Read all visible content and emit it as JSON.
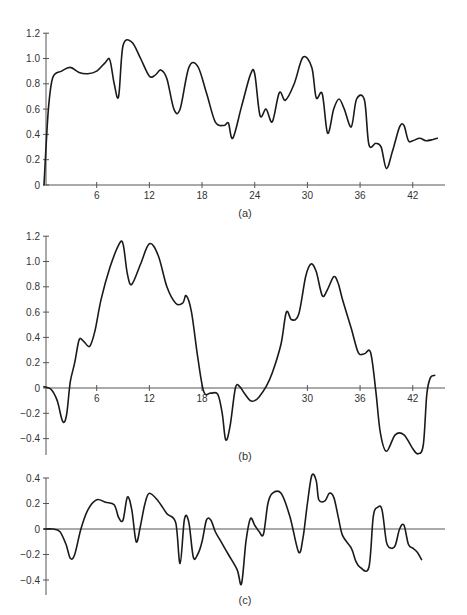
{
  "chart_data": [
    {
      "id": "a",
      "type": "line",
      "caption": "(a)",
      "xlabel": "",
      "ylabel": "",
      "xlim": [
        0,
        45
      ],
      "ylim": [
        0,
        1.2
      ],
      "x_ticks": [
        6,
        12,
        18,
        24,
        30,
        36,
        42
      ],
      "y_ticks": [
        0,
        0.2,
        0.4,
        0.6,
        0.8,
        1.0,
        1.2
      ],
      "y_tick_labels": [
        "0",
        "0.2",
        "0.4",
        "0.6",
        "0.8",
        "1.0",
        "1.2"
      ],
      "grid": false,
      "x": [
        0,
        0.5,
        1,
        2,
        3,
        4,
        5,
        6,
        7,
        7.5,
        8,
        8.5,
        9,
        10,
        11,
        12,
        12.7,
        13.3,
        14,
        14.8,
        15.5,
        16.5,
        17.5,
        18.5,
        19.5,
        20.5,
        21,
        21.5,
        22.5,
        23.5,
        24,
        24.6,
        25.3,
        26,
        26.8,
        27.5,
        28.5,
        29.5,
        30.5,
        31,
        31.7,
        32.3,
        33,
        33.6,
        34.2,
        35,
        35.6,
        36.5,
        37,
        37.8,
        38.4,
        39,
        39.7,
        40.5,
        41,
        41.5,
        42,
        42.8,
        43.5,
        44.3,
        44.8
      ],
      "values": [
        0,
        0.6,
        0.85,
        0.9,
        0.93,
        0.89,
        0.88,
        0.9,
        0.97,
        0.99,
        0.8,
        0.7,
        1.1,
        1.13,
        1.0,
        0.86,
        0.87,
        0.91,
        0.84,
        0.6,
        0.6,
        0.93,
        0.94,
        0.73,
        0.5,
        0.47,
        0.49,
        0.37,
        0.62,
        0.87,
        0.88,
        0.55,
        0.6,
        0.5,
        0.73,
        0.67,
        0.8,
        1.01,
        0.93,
        0.69,
        0.72,
        0.41,
        0.6,
        0.68,
        0.6,
        0.46,
        0.68,
        0.67,
        0.32,
        0.33,
        0.3,
        0.13,
        0.27,
        0.46,
        0.47,
        0.35,
        0.35,
        0.37,
        0.35,
        0.36,
        0.37
      ]
    },
    {
      "id": "b",
      "type": "line",
      "caption": "(b)",
      "xlabel": "",
      "ylabel": "",
      "xlim": [
        0,
        45
      ],
      "ylim": [
        -0.5,
        1.2
      ],
      "x_ticks": [
        6,
        12,
        18,
        30,
        36,
        42
      ],
      "y_ticks": [
        -0.4,
        -0.2,
        0,
        0.2,
        0.4,
        0.6,
        0.8,
        1.0,
        1.2
      ],
      "y_tick_labels": [
        "−0.4",
        "−0.2",
        "0",
        "0.2",
        "0.4",
        "0.6",
        "0.8",
        "1.0",
        "1.2"
      ],
      "grid": false,
      "zero_line": true,
      "x": [
        0,
        0.8,
        1.5,
        2,
        2.3,
        2.6,
        3,
        3.5,
        4,
        4.5,
        5.2,
        5.8,
        6.5,
        7.5,
        8.5,
        9,
        9.5,
        10,
        11,
        12,
        13,
        14,
        15,
        15.8,
        16.2,
        16.8,
        17.5,
        18.2,
        19,
        19.8,
        20.3,
        20.7,
        21.2,
        21.8,
        22.3,
        22.8,
        23.5,
        24,
        24.5,
        25.3,
        26,
        27,
        27.6,
        28.2,
        29,
        29.8,
        30.4,
        31,
        31.7,
        32.3,
        33,
        33.5,
        34,
        35,
        35.8,
        36.5,
        37.2,
        37.8,
        38.3,
        39,
        40,
        41,
        42,
        42.6,
        43.2,
        43.6,
        44,
        44.5
      ],
      "values": [
        0.01,
        -0.01,
        -0.1,
        -0.24,
        -0.27,
        -0.2,
        0.05,
        0.2,
        0.38,
        0.37,
        0.33,
        0.45,
        0.7,
        0.95,
        1.13,
        1.14,
        0.9,
        0.82,
        0.98,
        1.14,
        1.05,
        0.8,
        0.67,
        0.67,
        0.73,
        0.6,
        0.25,
        -0.03,
        -0.04,
        -0.05,
        -0.2,
        -0.41,
        -0.3,
        0.0,
        0.01,
        -0.04,
        -0.1,
        -0.1,
        -0.07,
        0.01,
        0.12,
        0.35,
        0.6,
        0.54,
        0.58,
        0.88,
        0.98,
        0.92,
        0.73,
        0.78,
        0.88,
        0.83,
        0.7,
        0.47,
        0.28,
        0.27,
        0.28,
        -0.03,
        -0.35,
        -0.5,
        -0.37,
        -0.37,
        -0.48,
        -0.52,
        -0.45,
        -0.05,
        0.08,
        0.1
      ]
    },
    {
      "id": "c",
      "type": "line",
      "caption": "(c)",
      "xlabel": "",
      "ylabel": "",
      "xlim": [
        0,
        45
      ],
      "ylim": [
        -0.5,
        0.4
      ],
      "x_ticks": [],
      "y_ticks": [
        -0.4,
        -0.2,
        0,
        0.2,
        0.4
      ],
      "y_tick_labels": [
        "−0.4",
        "−0.2",
        "0",
        "0.2",
        "0.4"
      ],
      "grid": false,
      "zero_line": true,
      "x": [
        0,
        1,
        1.8,
        2.5,
        3,
        3.5,
        4.2,
        5,
        6,
        7,
        8,
        8.5,
        9,
        9.5,
        10,
        10.5,
        11,
        11.5,
        12,
        13,
        14,
        15,
        15.5,
        16,
        16.5,
        17,
        17.5,
        18,
        18.5,
        19,
        19.5,
        20,
        21,
        22,
        22.5,
        23,
        23.5,
        24,
        24.5,
        25,
        25.5,
        26,
        27,
        28,
        29,
        29.5,
        30,
        30.5,
        31,
        31.3,
        32,
        32.5,
        33,
        33.5,
        34,
        35,
        35.5,
        36,
        37,
        37.5,
        38,
        38.5,
        39,
        39.5,
        40,
        40.5,
        41,
        41.5,
        42,
        42.5,
        43
      ],
      "values": [
        0,
        0,
        -0.02,
        -0.12,
        -0.23,
        -0.2,
        0.0,
        0.15,
        0.23,
        0.21,
        0.19,
        0.09,
        0.07,
        0.25,
        0.15,
        -0.1,
        0.03,
        0.2,
        0.28,
        0.22,
        0.12,
        0.05,
        -0.27,
        0.08,
        0.05,
        -0.22,
        -0.2,
        -0.1,
        0.07,
        0.07,
        -0.02,
        -0.08,
        -0.2,
        -0.32,
        -0.43,
        -0.1,
        0.08,
        0.03,
        -0.02,
        -0.04,
        0.2,
        0.28,
        0.28,
        0.1,
        -0.18,
        -0.07,
        0.2,
        0.42,
        0.38,
        0.23,
        0.22,
        0.28,
        0.25,
        0.1,
        -0.05,
        -0.15,
        -0.25,
        -0.3,
        -0.3,
        0.1,
        0.17,
        0.15,
        -0.1,
        -0.15,
        -0.13,
        0.0,
        0.03,
        -0.12,
        -0.15,
        -0.18,
        -0.24
      ]
    }
  ]
}
